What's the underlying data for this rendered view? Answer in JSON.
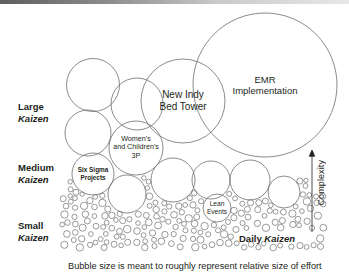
{
  "figure": {
    "type": "bubble-diagram",
    "caption": "Bubble size is meant to roughly represent relative size of effort",
    "axis": {
      "label": "Complexity",
      "direction": "up",
      "icon": "up-arrow-icon"
    }
  },
  "category_labels": [
    {
      "size": "Large",
      "term": "Kaizen"
    },
    {
      "size": "Medium",
      "term": "Kaizen"
    },
    {
      "size": "Small",
      "term": "Kaizen"
    }
  ],
  "bubbles": [
    {
      "name": "emr-implementation",
      "lines": [
        "EMR",
        "Implementation"
      ],
      "cx": 265,
      "cy": 85,
      "r": 72,
      "size_class": "Large"
    },
    {
      "name": "new-indy-bed-tower",
      "lines": [
        "New Indy",
        "Bed Tower"
      ],
      "cx": 183,
      "cy": 101,
      "r": 42,
      "size_class": "Large"
    },
    {
      "name": "large-unlabeled-1",
      "lines": [],
      "cx": 93,
      "cy": 85,
      "r": 26.5,
      "size_class": "Large"
    },
    {
      "name": "large-unlabeled-2",
      "lines": [],
      "cx": 137,
      "cy": 104,
      "r": 26,
      "size_class": "Large"
    },
    {
      "name": "womens-childrens-3p",
      "lines": [
        "Women's",
        "and Children's",
        "3P"
      ],
      "cx": 136,
      "cy": 148,
      "r": 27,
      "size_class": "Medium"
    },
    {
      "name": "medium-unlabeled-1",
      "lines": [],
      "cx": 88,
      "cy": 133,
      "r": 23,
      "size_class": "Medium"
    },
    {
      "name": "six-sigma-projects",
      "lines": [
        "Six Sigma",
        "Projects"
      ],
      "cx": 93,
      "cy": 174,
      "r": 21,
      "size_class": "Medium"
    },
    {
      "name": "medium-unlabeled-2",
      "lines": [],
      "cx": 173,
      "cy": 180,
      "r": 22,
      "size_class": "Medium"
    },
    {
      "name": "medium-unlabeled-3",
      "lines": [],
      "cx": 211,
      "cy": 180,
      "r": 19,
      "size_class": "Medium"
    },
    {
      "name": "medium-unlabeled-4",
      "lines": [],
      "cx": 250,
      "cy": 180,
      "r": 20,
      "size_class": "Medium"
    },
    {
      "name": "medium-unlabeled-5",
      "lines": [],
      "cx": 284,
      "cy": 192,
      "r": 16,
      "size_class": "Medium"
    },
    {
      "name": "medium-unlabeled-6",
      "lines": [],
      "cx": 127,
      "cy": 194,
      "r": 19,
      "size_class": "Medium"
    },
    {
      "name": "lean-events",
      "lines": [
        "Lean",
        "Events"
      ],
      "cx": 217,
      "cy": 208,
      "r": 14,
      "size_class": "Medium"
    }
  ],
  "daily_kaizen": {
    "prefix": "Daily",
    "term": "Kaizen"
  },
  "colors": {
    "stroke": "#6d6e71",
    "text": "#231f20",
    "background": "#ffffff",
    "topband": "#5f5f5f"
  }
}
